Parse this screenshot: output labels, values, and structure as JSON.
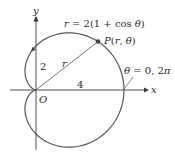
{
  "diagram": {
    "type": "polar-curve",
    "equation_label": "r = 2(1 + cos θ)",
    "point_label": "P(r, θ)",
    "radius_label": "r",
    "start_label": "θ = 0, 2π",
    "axis_labels": {
      "x": "x",
      "y": "y",
      "origin": "O"
    },
    "value_labels": {
      "y_intercept": "2",
      "x_intercept": "4"
    },
    "colors": {
      "curve": "#555555",
      "axis": "#3a3a3a",
      "text": "#2a2a2a",
      "point": "#444444"
    },
    "geometry": {
      "a": 2,
      "origin_px": [
        36,
        90
      ],
      "scale_px_per_unit": 22,
      "point_theta_deg": 38,
      "arrow_theta_deg": 95
    }
  }
}
